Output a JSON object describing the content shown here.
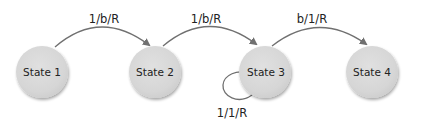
{
  "diagram": {
    "type": "state-machine",
    "colors": {
      "node_fill": "#d9d9d9",
      "node_shadow": "#b8b8b8",
      "edge": "#707070",
      "text": "#222222",
      "background": "#ffffff"
    },
    "states": [
      {
        "id": "s1",
        "label": "State 1"
      },
      {
        "id": "s2",
        "label": "State 2"
      },
      {
        "id": "s3",
        "label": "State 3"
      },
      {
        "id": "s4",
        "label": "State 4"
      }
    ],
    "transitions": [
      {
        "from": "s1",
        "to": "s2",
        "read": "1",
        "write": "b",
        "move": "R",
        "label": "1/b/R"
      },
      {
        "from": "s2",
        "to": "s3",
        "read": "1",
        "write": "b",
        "move": "R",
        "label": "1/b/R"
      },
      {
        "from": "s3",
        "to": "s4",
        "read": "b",
        "write": "1",
        "move": "R",
        "label": "b/1/R"
      },
      {
        "from": "s3",
        "to": "s3",
        "read": "1",
        "write": "1",
        "move": "R",
        "label": "1/1/R"
      }
    ]
  }
}
